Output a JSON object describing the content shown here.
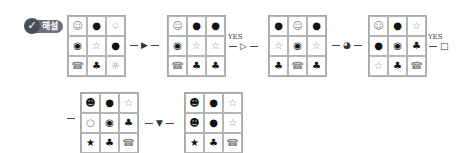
{
  "badge": {
    "icon": "check-icon",
    "label": "해설"
  },
  "steps": [
    {
      "cells": [
        [
          "☺",
          "●",
          "♤"
        ],
        [
          "◉",
          "☆",
          "●"
        ],
        [
          "☎",
          "♣",
          "☼"
        ]
      ]
    },
    {
      "cells": [
        [
          "☺",
          "●",
          "●"
        ],
        [
          "◉",
          "☆",
          "☆"
        ],
        [
          "☎",
          "♣",
          "♣"
        ]
      ]
    },
    {
      "cells": [
        [
          "●",
          "☺",
          "●"
        ],
        [
          "☆",
          "◉",
          "☆"
        ],
        [
          "♣",
          "☎",
          "♣"
        ]
      ]
    },
    {
      "cells": [
        [
          "☺",
          "●",
          "☆"
        ],
        [
          "●",
          "◉",
          "♣"
        ],
        [
          "☆",
          "♣",
          "☎"
        ]
      ]
    },
    {
      "cells": [
        [
          "☻",
          "●",
          "☆"
        ],
        [
          "○",
          "◉",
          "♣"
        ],
        [
          "★",
          "♣",
          "☎"
        ]
      ]
    },
    {
      "cells": [
        [
          "☻",
          "●",
          "☆"
        ],
        [
          "☻",
          "●",
          "☆"
        ],
        [
          "★",
          "♣",
          "☎"
        ]
      ]
    }
  ],
  "arrows": [
    {
      "symbol": "▶",
      "label": ""
    },
    {
      "symbol": "▷",
      "label": "YES"
    },
    {
      "symbol": "◕",
      "label": ""
    },
    {
      "symbol": "□",
      "label": "YES"
    },
    {
      "symbol": "",
      "label": ""
    },
    {
      "symbol": "▼",
      "label": ""
    }
  ]
}
